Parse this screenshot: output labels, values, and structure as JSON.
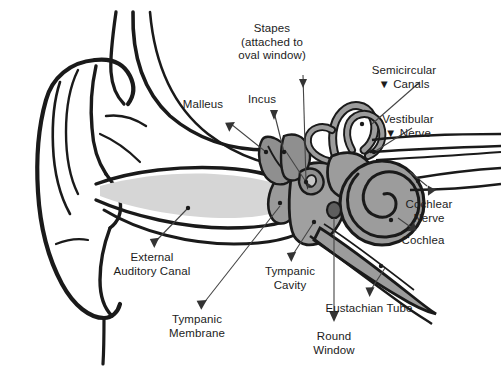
{
  "diagram": {
    "background_color": "#ffffff",
    "ink_color": "#1a1a1a",
    "palette": {
      "outline": "#1a1a1a",
      "canal_fill": "#d6d6d6",
      "membrane_fill": "#9a9a9a",
      "middle_ear_fill": "#a0a0a0",
      "inner_ear_fill": "#9c9c9c",
      "ossicle_fill": "#8f8f8f",
      "leader_line": "#444444",
      "label_text": "#1c1c1c"
    },
    "labels": [
      {
        "id": "stapes",
        "text": "Stapes\n(attached to\noval window)",
        "x": 272,
        "y": 22,
        "align": "center"
      },
      {
        "id": "semicircular",
        "text": "Semicircular\n▼ Canals",
        "x": 404,
        "y": 64,
        "align": "center"
      },
      {
        "id": "vestibular-nerve",
        "text": "Vestibular\n▼ Nerve",
        "x": 408,
        "y": 113,
        "align": "center"
      },
      {
        "id": "incus",
        "text": "Incus",
        "x": 262,
        "y": 93,
        "align": "center"
      },
      {
        "id": "malleus",
        "text": "Malleus",
        "x": 203,
        "y": 98,
        "align": "center"
      },
      {
        "id": "cochlear-nerve",
        "text": "Cochlear\nNerve",
        "x": 429,
        "y": 198,
        "align": "center"
      },
      {
        "id": "cochlea",
        "text": "Cochlea",
        "x": 423,
        "y": 234,
        "align": "center"
      },
      {
        "id": "eustachian-tube",
        "text": "Eustachian Tube",
        "x": 369,
        "y": 302,
        "align": "center"
      },
      {
        "id": "round-window",
        "text": "Round\nWindow",
        "x": 334,
        "y": 330,
        "align": "center"
      },
      {
        "id": "tympanic-cavity",
        "text": "Tympanic\nCavity",
        "x": 290,
        "y": 265,
        "align": "center"
      },
      {
        "id": "tympanic-membrane",
        "text": "Tympanic\nMembrane",
        "x": 197,
        "y": 313,
        "align": "center"
      },
      {
        "id": "external-auditory-canal",
        "text": "External\nAuditory Canal",
        "x": 152,
        "y": 251,
        "align": "center"
      }
    ],
    "structures": [
      {
        "id": "pinna",
        "name": "Outer ear / pinna"
      },
      {
        "id": "external-auditory-canal",
        "name": "External auditory canal"
      },
      {
        "id": "tympanic-membrane",
        "name": "Tympanic membrane (eardrum)"
      },
      {
        "id": "malleus",
        "name": "Malleus (hammer)"
      },
      {
        "id": "incus",
        "name": "Incus (anvil)"
      },
      {
        "id": "stapes",
        "name": "Stapes (stirrup)"
      },
      {
        "id": "tympanic-cavity",
        "name": "Tympanic cavity (middle ear)"
      },
      {
        "id": "semicircular-canals",
        "name": "Semicircular canals"
      },
      {
        "id": "vestibular-nerve",
        "name": "Vestibular nerve"
      },
      {
        "id": "cochlear-nerve",
        "name": "Cochlear nerve"
      },
      {
        "id": "cochlea",
        "name": "Cochlea"
      },
      {
        "id": "round-window",
        "name": "Round window"
      },
      {
        "id": "eustachian-tube",
        "name": "Eustachian tube"
      }
    ]
  }
}
